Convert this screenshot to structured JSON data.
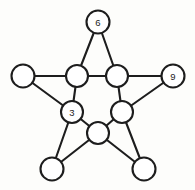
{
  "diagram": {
    "type": "pentagram-graph",
    "canvas": {
      "width": 195,
      "height": 190
    },
    "style": {
      "background_color": "#fdfdfb",
      "stroke_color": "#1d1d1d",
      "node_fill_color": "#ffffff",
      "stroke_width": 2.1,
      "outer_node_radius": 11.5,
      "inner_node_radius": 11.0
    },
    "nodes": [
      {
        "id": "outer-top",
        "label": "6",
        "filled": true,
        "ring": "outer",
        "cx": 98,
        "cy": 22,
        "r": 11.5
      },
      {
        "id": "outer-right",
        "label": "9",
        "filled": true,
        "ring": "outer",
        "cx": 173,
        "cy": 76,
        "r": 11.5
      },
      {
        "id": "outer-left",
        "label": "",
        "filled": false,
        "ring": "outer",
        "cx": 23,
        "cy": 76,
        "r": 11.5
      },
      {
        "id": "outer-bottom-left",
        "label": "",
        "filled": false,
        "ring": "outer",
        "cx": 52,
        "cy": 169,
        "r": 11.5
      },
      {
        "id": "outer-bottom-right",
        "label": "",
        "filled": false,
        "ring": "outer",
        "cx": 144,
        "cy": 169,
        "r": 11.5
      },
      {
        "id": "inner-top-left",
        "label": "",
        "filled": false,
        "ring": "inner",
        "cx": 77,
        "cy": 76,
        "r": 11.0
      },
      {
        "id": "inner-top-right",
        "label": "",
        "filled": false,
        "ring": "inner",
        "cx": 117,
        "cy": 76,
        "r": 11.0
      },
      {
        "id": "inner-left",
        "label": "3",
        "filled": true,
        "ring": "inner",
        "cx": 72,
        "cy": 112,
        "r": 11.0
      },
      {
        "id": "inner-right",
        "label": "",
        "filled": false,
        "ring": "inner",
        "cx": 122,
        "cy": 112,
        "r": 11.0
      },
      {
        "id": "inner-bottom",
        "label": "",
        "filled": false,
        "ring": "inner",
        "cx": 98,
        "cy": 133,
        "r": 11.0
      }
    ],
    "edges": [
      {
        "from": "outer-top",
        "to": "inner-top-left"
      },
      {
        "from": "outer-top",
        "to": "inner-top-right"
      },
      {
        "from": "outer-left",
        "to": "inner-top-left"
      },
      {
        "from": "outer-left",
        "to": "inner-left"
      },
      {
        "from": "outer-right",
        "to": "inner-top-right"
      },
      {
        "from": "outer-right",
        "to": "inner-right"
      },
      {
        "from": "outer-bottom-left",
        "to": "inner-left"
      },
      {
        "from": "outer-bottom-left",
        "to": "inner-bottom"
      },
      {
        "from": "outer-bottom-right",
        "to": "inner-right"
      },
      {
        "from": "outer-bottom-right",
        "to": "inner-bottom"
      },
      {
        "from": "inner-top-left",
        "to": "inner-top-right"
      },
      {
        "from": "inner-top-left",
        "to": "inner-left"
      },
      {
        "from": "inner-top-right",
        "to": "inner-right"
      },
      {
        "from": "inner-left",
        "to": "inner-bottom"
      },
      {
        "from": "inner-right",
        "to": "inner-bottom"
      }
    ]
  }
}
